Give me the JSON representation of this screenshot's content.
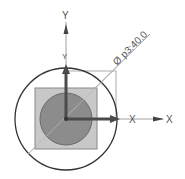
{
  "diagram": {
    "axes": {
      "y_label": "Y",
      "y_label_inner": "Y",
      "x_label": "X",
      "x_label_inner": "X"
    },
    "dimension": {
      "text": "Ø p3:40.0"
    },
    "colors": {
      "outer_circle": "#333333",
      "square_fill": "#c8c8c8",
      "inner_circle_fill": "#8c8c8c",
      "axis_arrow": "#4a4a4a",
      "thin_line": "#999999"
    }
  }
}
